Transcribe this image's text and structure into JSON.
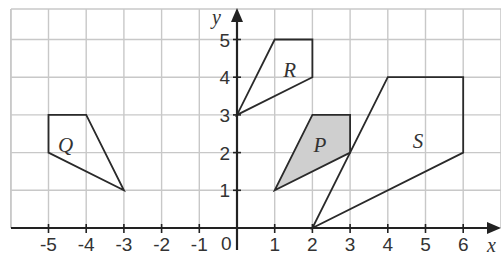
{
  "diagram": {
    "type": "coordinate-grid",
    "x_axis": {
      "label": "x",
      "min": -5,
      "max": 6,
      "ticks": [
        "-5",
        "-4",
        "-3",
        "-2",
        "-1",
        "1",
        "2",
        "3",
        "4",
        "5",
        "6"
      ]
    },
    "y_axis": {
      "label": "y",
      "min": 0,
      "max": 5,
      "ticks": [
        "1",
        "2",
        "3",
        "4",
        "5"
      ]
    },
    "origin_label": "0",
    "shapes": [
      {
        "name": "Q",
        "vertices": [
          [
            -5,
            3
          ],
          [
            -4,
            3
          ],
          [
            -3,
            1
          ],
          [
            -5,
            2
          ]
        ],
        "shaded": false,
        "label_pos": [
          -4.55,
          2.2
        ]
      },
      {
        "name": "R",
        "vertices": [
          [
            1,
            5
          ],
          [
            2,
            5
          ],
          [
            2,
            4
          ],
          [
            0,
            3
          ]
        ],
        "shaded": false,
        "label_pos": [
          1.4,
          4.2
        ]
      },
      {
        "name": "P",
        "vertices": [
          [
            2,
            3
          ],
          [
            3,
            3
          ],
          [
            3,
            2
          ],
          [
            1,
            1
          ]
        ],
        "shaded": true,
        "label_pos": [
          2.2,
          2.2
        ]
      },
      {
        "name": "S",
        "vertices": [
          [
            4,
            4
          ],
          [
            6,
            4
          ],
          [
            6,
            2
          ],
          [
            2,
            0
          ]
        ],
        "shaded": false,
        "label_pos": [
          4.8,
          2.3
        ]
      }
    ],
    "colors": {
      "grid": "#c8c8c8",
      "axis": "#222222",
      "shape_stroke": "#2a2a2a",
      "shade_fill": "#cfcfcf"
    }
  }
}
